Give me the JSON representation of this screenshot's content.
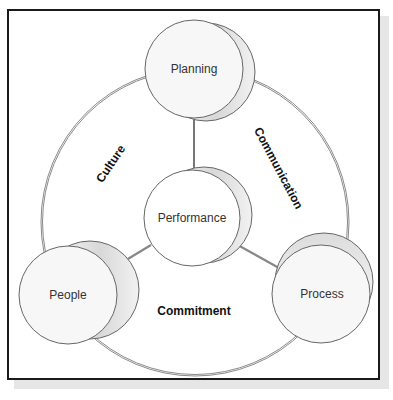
{
  "diagram": {
    "type": "cycle-with-hub",
    "hub": {
      "label": "Performance"
    },
    "nodes": [
      {
        "label": "Planning"
      },
      {
        "label": "People"
      },
      {
        "label": "Process"
      }
    ],
    "ring_labels": {
      "top_left": "Culture",
      "top_right": "Communication",
      "bottom": "Commitment"
    },
    "colors": {
      "border": "#1a1a1a",
      "ring": "#888888",
      "circle_fill": "#f7f7f7",
      "circle_stroke": "#666666",
      "cylinder_shade": "#d6d6d6"
    }
  }
}
